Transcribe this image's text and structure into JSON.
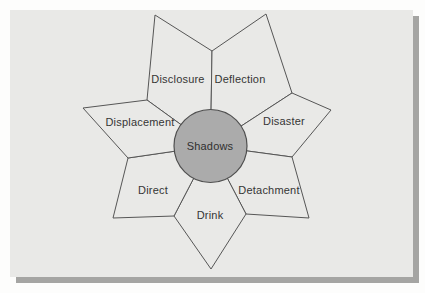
{
  "figure": {
    "type": "flower-diagram",
    "center": {
      "label": "Shadows"
    },
    "petals": [
      {
        "label": "Disclosure"
      },
      {
        "label": "Deflection"
      },
      {
        "label": "Disaster"
      },
      {
        "label": "Detachment"
      },
      {
        "label": "Drink"
      },
      {
        "label": "Direct"
      },
      {
        "label": "Displacement"
      }
    ]
  },
  "colors": {
    "page_background": "#fdfdfc",
    "slide_background": "#e9e9e7",
    "slide_shadow": "#a5a5a3",
    "petal_outline": "#565656",
    "circle_fill": "#ababab",
    "circle_outline": "#4f4f4f",
    "text": "#353535"
  }
}
